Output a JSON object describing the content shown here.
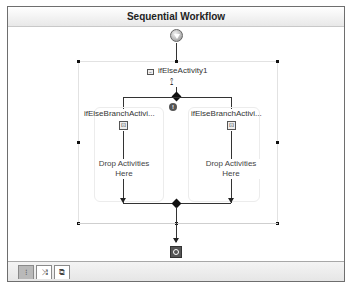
{
  "designer": {
    "title": "Sequential Workflow",
    "start_icon": "workflow-start-icon",
    "end_icon": "workflow-end-icon"
  },
  "ifelse": {
    "name": "ifElseActivity1",
    "collapse_icon": "collapse-icon",
    "type_icon": "ifelse-icon",
    "branches": [
      {
        "name": "ifElseBranchActivi...",
        "drop_text_line1": "Drop Activities",
        "drop_text_line2": "Here",
        "icon": "branch-icon"
      },
      {
        "name": "ifElseBranchActivi...",
        "drop_text_line1": "Drop Activities",
        "drop_text_line2": "Here",
        "icon": "branch-icon"
      }
    ],
    "warning_icon": "error-indicator-icon"
  },
  "footer": {
    "tabs": [
      {
        "name": "workflow-view-tab",
        "glyph": "⁝",
        "active": true
      },
      {
        "name": "cancel-handler-view-tab",
        "glyph": "⤨",
        "active": false
      },
      {
        "name": "fault-handlers-view-tab",
        "glyph": "⧉",
        "active": false
      }
    ]
  }
}
